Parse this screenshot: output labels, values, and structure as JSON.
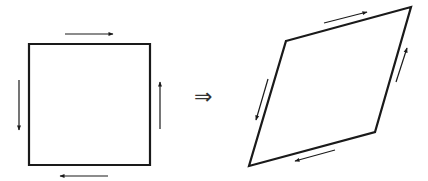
{
  "diagram": {
    "colors": {
      "stroke": "#1a1a1a",
      "background": "#ffffff"
    },
    "left_shape": {
      "type": "square",
      "corners": [
        [
          29,
          44
        ],
        [
          150,
          44
        ],
        [
          150,
          165
        ],
        [
          29,
          165
        ]
      ],
      "arrows": [
        {
          "side": "top",
          "direction": "right",
          "from": [
            65,
            34
          ],
          "to": [
            113,
            34
          ]
        },
        {
          "side": "right",
          "direction": "up",
          "from": [
            160,
            129
          ],
          "to": [
            160,
            82
          ]
        },
        {
          "side": "bottom",
          "direction": "left",
          "from": [
            108,
            176
          ],
          "to": [
            60,
            176
          ]
        },
        {
          "side": "left",
          "direction": "down",
          "from": [
            19,
            80
          ],
          "to": [
            19,
            130
          ]
        }
      ]
    },
    "transition_symbol": "⇒",
    "right_shape": {
      "type": "parallelogram",
      "corners": [
        [
          286,
          41
        ],
        [
          411,
          7
        ],
        [
          375,
          132
        ],
        [
          249,
          166
        ]
      ],
      "arrows": [
        {
          "side": "top",
          "direction": "right",
          "from": [
            324,
            23
          ],
          "to": [
            367,
            12
          ]
        },
        {
          "side": "right",
          "direction": "up",
          "from": [
            396,
            82
          ],
          "to": [
            407,
            48
          ]
        },
        {
          "side": "bottom",
          "direction": "left",
          "from": [
            335,
            150
          ],
          "to": [
            295,
            161
          ]
        },
        {
          "side": "left",
          "direction": "down",
          "from": [
            268,
            79
          ],
          "to": [
            256,
            120
          ]
        }
      ]
    }
  }
}
